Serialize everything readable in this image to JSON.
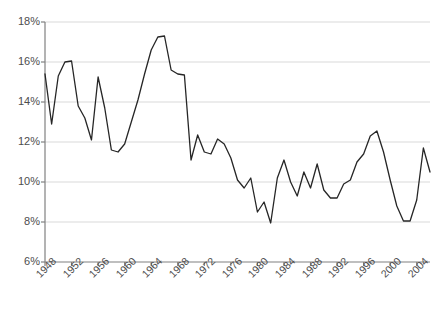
{
  "chart_data": {
    "type": "line",
    "title": "",
    "subtitle": "",
    "xlabel": "",
    "ylabel": "",
    "xlim": [
      1948,
      2006
    ],
    "ylim": [
      6,
      18
    ],
    "ytick_labels": [
      "18%",
      "16%",
      "14%",
      "12%",
      "10%",
      "8%",
      "6%"
    ],
    "ytick_values": [
      18,
      16,
      14,
      12,
      10,
      8,
      6
    ],
    "xtick_labels": [
      "1948",
      "1952",
      "1956",
      "1960",
      "1964",
      "1968",
      "1972",
      "1976",
      "1980",
      "1984",
      "1988",
      "1992",
      "1996",
      "2000",
      "2004"
    ],
    "xtick_values": [
      1948,
      1952,
      1956,
      1960,
      1964,
      1968,
      1972,
      1976,
      1980,
      1984,
      1988,
      1992,
      1996,
      2000,
      2004
    ],
    "grid": "horizontal",
    "legend": "none",
    "line_color": "#262626",
    "grid_color": "#d9d9d9",
    "axis_color": "#808080",
    "x": [
      1948,
      1949,
      1950,
      1951,
      1952,
      1953,
      1954,
      1955,
      1956,
      1957,
      1958,
      1959,
      1960,
      1961,
      1962,
      1963,
      1964,
      1965,
      1966,
      1967,
      1968,
      1969,
      1970,
      1971,
      1972,
      1973,
      1974,
      1975,
      1976,
      1977,
      1978,
      1979,
      1980,
      1981,
      1982,
      1983,
      1984,
      1985,
      1986,
      1987,
      1988,
      1989,
      1990,
      1991,
      1992,
      1993,
      1994,
      1995,
      1996,
      1997,
      1998,
      1999,
      2000,
      2001,
      2002,
      2003,
      2004,
      2005,
      2006
    ],
    "y": [
      15.4,
      12.9,
      15.3,
      16.0,
      16.05,
      13.8,
      13.2,
      12.1,
      15.25,
      13.7,
      11.6,
      11.5,
      11.9,
      13.0,
      14.1,
      15.4,
      16.6,
      17.25,
      17.3,
      15.6,
      15.4,
      15.35,
      11.1,
      12.35,
      11.5,
      11.4,
      12.15,
      11.9,
      11.2,
      10.1,
      9.7,
      10.2,
      8.5,
      9.0,
      7.95,
      10.2,
      11.1,
      10.0,
      9.3,
      10.5,
      9.7,
      10.9,
      9.6,
      9.2,
      9.2,
      9.9,
      10.1,
      11.0,
      11.4,
      12.3,
      12.55,
      11.5,
      10.1,
      8.8,
      8.05,
      8.05,
      9.1,
      11.7,
      10.5
    ]
  }
}
